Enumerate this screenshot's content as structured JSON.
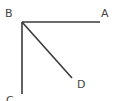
{
  "diagram": {
    "type": "geometry-angle-rays",
    "vertex": "B",
    "points": [
      {
        "name": "B",
        "label": "B",
        "x": 22,
        "y": 22,
        "label_x": 5,
        "label_y": 17
      },
      {
        "name": "A",
        "label": "A",
        "x": 100,
        "y": 22,
        "label_x": 101,
        "label_y": 17
      },
      {
        "name": "C",
        "label": "C",
        "x": 22,
        "y": 94,
        "label_x": 6,
        "label_y": 104
      },
      {
        "name": "D",
        "label": "D",
        "x": 72,
        "y": 78,
        "label_x": 77,
        "label_y": 88
      }
    ],
    "segments": [
      {
        "name": "BA",
        "from": "B",
        "to": "A"
      },
      {
        "name": "BC",
        "from": "B",
        "to": "C"
      },
      {
        "name": "BD",
        "from": "B",
        "to": "D"
      }
    ],
    "colors": {
      "line": "#3a3a3a",
      "label": "#444444",
      "background": "#ffffff"
    }
  }
}
